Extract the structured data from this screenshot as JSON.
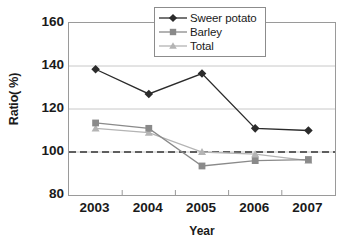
{
  "chart_data": {
    "type": "line",
    "title": "",
    "xlabel": "Year",
    "ylabel": "Ratio( %)",
    "categories": [
      "2003",
      "2004",
      "2005",
      "2006",
      "2007"
    ],
    "ylim": [
      80,
      160
    ],
    "yticks": [
      80,
      100,
      120,
      140,
      160
    ],
    "ytick_labels": [
      "80",
      "100",
      "120",
      "140",
      "160"
    ],
    "grid": "horizontal-gridlines-at-100-120-140",
    "legend_position": "top-right-inside",
    "reference_line": {
      "value": 100,
      "style": "dashed",
      "color": "#333333"
    },
    "series": [
      {
        "name": "Sweer potato",
        "marker": "diamond",
        "color": "#2b2b2b",
        "values": [
          138.5,
          127.0,
          136.5,
          111.0,
          110.0
        ]
      },
      {
        "name": "Barley",
        "marker": "square",
        "color": "#8a8a8a",
        "values": [
          113.5,
          111.0,
          93.5,
          96.0,
          96.5
        ]
      },
      {
        "name": "Total",
        "marker": "triangle",
        "color": "#b4b4b4",
        "values": [
          111.0,
          109.0,
          100.0,
          99.0,
          96.0
        ]
      }
    ]
  },
  "colors": {
    "background": "#ffffff",
    "frame": "#9a9a9a",
    "gridline": "#c8c8c8",
    "text": "#1a1a1a"
  }
}
